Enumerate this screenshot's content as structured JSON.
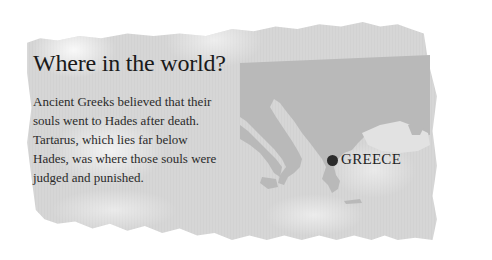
{
  "panel": {
    "title": "Where in the world?",
    "body_lines": [
      "Ancient Greeks believed that their",
      "souls went to Hades after death.",
      "Tartarus, which lies far below",
      "Hades, was where those souls were",
      "judged and punished."
    ]
  },
  "map": {
    "marker_label": "GREECE",
    "marker_color": "#2b2b2b",
    "land_color": "#b8b8b8",
    "sea_color": "#e4e4e4"
  }
}
